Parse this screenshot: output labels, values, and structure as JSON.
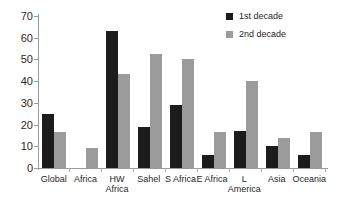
{
  "chart_data": {
    "type": "bar",
    "title": "",
    "subtitle": "",
    "xlabel": "",
    "ylabel": "",
    "ylim": [
      0,
      70
    ],
    "yticks": [
      0,
      10,
      20,
      30,
      40,
      50,
      60,
      70
    ],
    "grid": false,
    "legend_position": "top-right",
    "categories": [
      "Global",
      "Africa",
      "HW Africa",
      "Sahel",
      "S Africa",
      "E Africa",
      "L America",
      "Asia",
      "Oceania"
    ],
    "category_lines": [
      [
        "Global",
        ""
      ],
      [
        "Africa",
        ""
      ],
      [
        "HW",
        "Africa"
      ],
      [
        "Sahel",
        ""
      ],
      [
        "S Africa",
        ""
      ],
      [
        "E Africa",
        ""
      ],
      [
        "L",
        "America"
      ],
      [
        "Asia",
        ""
      ],
      [
        "Oceania",
        ""
      ]
    ],
    "series": [
      {
        "name": "1st decade",
        "color": "#1c1c1c",
        "values": [
          25,
          null,
          63,
          19,
          29,
          6,
          17,
          10,
          6
        ]
      },
      {
        "name": "2nd decade",
        "color": "#9b9b9b",
        "values": [
          16.5,
          9,
          43.5,
          52.5,
          50,
          16.5,
          40,
          14,
          16.5
        ]
      }
    ]
  },
  "legend": {
    "items": [
      {
        "label": "1st decade",
        "swatch": "legend-swatch-1st-decade"
      },
      {
        "label": "2nd decade",
        "swatch": "legend-swatch-2nd-decade"
      }
    ]
  }
}
